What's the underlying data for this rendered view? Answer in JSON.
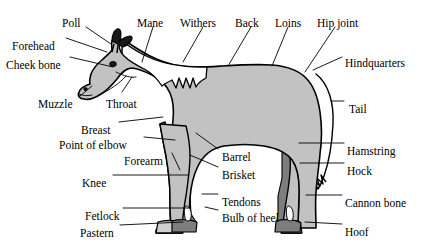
{
  "diagram": {
    "background_color": "#ffffff",
    "colors": {
      "body_fill": "#c2c2c2",
      "far_leg_fill": "#7e7e7e",
      "near_hoof_fill": "#cfcfcf",
      "mane_fill": "#ffffff",
      "outline": "#000000",
      "leader_line": "#000000",
      "text": "#000000"
    },
    "labels": [
      {
        "id": "poll",
        "text": "Poll",
        "x": 62,
        "y": 18,
        "align": "left"
      },
      {
        "id": "mane",
        "text": "Mane",
        "x": 137,
        "y": 18,
        "align": "left"
      },
      {
        "id": "withers",
        "text": "Withers",
        "x": 180,
        "y": 18,
        "align": "left"
      },
      {
        "id": "back",
        "text": "Back",
        "x": 235,
        "y": 18,
        "align": "left"
      },
      {
        "id": "loins",
        "text": "Loins",
        "x": 275,
        "y": 18,
        "align": "left"
      },
      {
        "id": "hip-joint",
        "text": "Hip joint",
        "x": 317,
        "y": 18,
        "align": "left"
      },
      {
        "id": "forehead",
        "text": "Forehead",
        "x": 12,
        "y": 41,
        "align": "left"
      },
      {
        "id": "cheek-bone",
        "text": "Cheek bone",
        "x": 6,
        "y": 60,
        "align": "left"
      },
      {
        "id": "hindquarters",
        "text": "Hindquarters",
        "x": 345,
        "y": 58,
        "align": "left"
      },
      {
        "id": "muzzle",
        "text": "Muzzle",
        "x": 38,
        "y": 99,
        "align": "left"
      },
      {
        "id": "throat",
        "text": "Throat",
        "x": 106,
        "y": 99,
        "align": "left"
      },
      {
        "id": "tail",
        "text": "Tail",
        "x": 349,
        "y": 104,
        "align": "left"
      },
      {
        "id": "breast",
        "text": "Breast",
        "x": 81,
        "y": 125,
        "align": "left"
      },
      {
        "id": "point-of-elbow",
        "text": "Point of elbow",
        "x": 59,
        "y": 140,
        "align": "left"
      },
      {
        "id": "hamstring",
        "text": "Hamstring",
        "x": 347,
        "y": 146,
        "align": "left"
      },
      {
        "id": "barrel",
        "text": "Barrel",
        "x": 222,
        "y": 152,
        "align": "left"
      },
      {
        "id": "forearm",
        "text": "Forearm",
        "x": 124,
        "y": 156,
        "align": "left"
      },
      {
        "id": "brisket",
        "text": "Brisket",
        "x": 222,
        "y": 170,
        "align": "left"
      },
      {
        "id": "hock",
        "text": "Hock",
        "x": 347,
        "y": 166,
        "align": "left"
      },
      {
        "id": "knee",
        "text": "Knee",
        "x": 82,
        "y": 178,
        "align": "left"
      },
      {
        "id": "tendons",
        "text": "Tendons",
        "x": 222,
        "y": 197,
        "align": "left"
      },
      {
        "id": "cannon-bone",
        "text": "Cannon bone",
        "x": 345,
        "y": 198,
        "align": "left"
      },
      {
        "id": "fetlock",
        "text": "Fetlock",
        "x": 85,
        "y": 211,
        "align": "left"
      },
      {
        "id": "bulb-of-heel",
        "text": "Bulb of heel",
        "x": 222,
        "y": 213,
        "align": "left"
      },
      {
        "id": "pastern",
        "text": "Pastern",
        "x": 80,
        "y": 228,
        "align": "left"
      },
      {
        "id": "hoof",
        "text": "Hoof",
        "x": 345,
        "y": 227,
        "align": "left"
      }
    ],
    "leader_lines": [
      {
        "id": "poll",
        "points": "86,27 111,44"
      },
      {
        "id": "mane",
        "points": "153,27 142,62"
      },
      {
        "id": "withers",
        "points": "203,27 183,62"
      },
      {
        "id": "back",
        "points": "251,27 228,66"
      },
      {
        "id": "loins",
        "points": "288,27 272,66"
      },
      {
        "id": "hip-joint",
        "points": "335,27 305,72"
      },
      {
        "id": "forehead",
        "points": "66,38 107,52"
      },
      {
        "id": "cheek-bone",
        "points": "70,57 113,67"
      },
      {
        "id": "hindquarters",
        "points": "342,57 313,70"
      },
      {
        "id": "muzzle",
        "points": "80,96 92,86"
      },
      {
        "id": "throat",
        "points": "122,92 132,77"
      },
      {
        "id": "tail",
        "points": "344,101 331,101"
      },
      {
        "id": "breast",
        "points": "119,122 163,117"
      },
      {
        "id": "point-of-elbow",
        "points": "144,137 175,140"
      },
      {
        "id": "hamstring",
        "points": "344,143 299,143"
      },
      {
        "id": "barrel",
        "points": "218,149 196,133"
      },
      {
        "id": "forearm",
        "points": "172,153 180,170"
      },
      {
        "id": "brisket",
        "points": "218,167 190,155"
      },
      {
        "id": "hock",
        "points": "344,163 300,163"
      },
      {
        "id": "knee",
        "points": "113,175 188,175"
      },
      {
        "id": "tendons",
        "points": "218,194 202,194"
      },
      {
        "id": "cannon-bone",
        "points": "342,195 306,195"
      },
      {
        "id": "fetlock",
        "points": "123,208 190,208"
      },
      {
        "id": "bulb-of-heel",
        "points": "218,210 205,207"
      },
      {
        "id": "pastern",
        "points": "120,225 183,222"
      },
      {
        "id": "hoof",
        "points": "342,224 305,222"
      }
    ]
  }
}
